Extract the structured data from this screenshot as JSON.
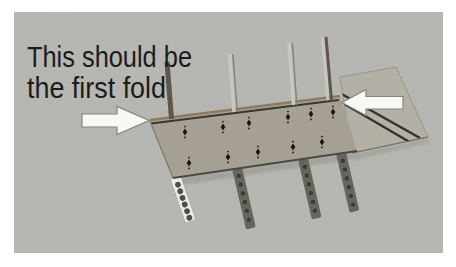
{
  "annotation": {
    "line1": "This should be",
    "line2": "the first fold"
  },
  "icons": {
    "left_arrow": "arrow-pointing-right",
    "right_arrow": "arrow-pointing-left"
  },
  "colors": {
    "page_background": "#ffffff",
    "photo_background": "#b6b6b2",
    "cardboard_body": "#a5a093",
    "corner_flap": "#b4b1a7",
    "top_edge": "#8f7a60",
    "fold_line": "#3a362e",
    "bottom_edge": "#4a473f",
    "diagonal_line": "#33312a",
    "arrow_fill": "#f8f8f5",
    "arrow_outline": "#85857f",
    "annotation_text": "#1c1c1a",
    "strip_dark": "#65635a",
    "strip_hole_dark": "#3b3a33",
    "strip_light": "#edece8",
    "strip_hole_light": "#4e4e48",
    "stick_dark": "#5f5546",
    "stick_light": "#c8c8c2",
    "marking": "#17150f"
  }
}
